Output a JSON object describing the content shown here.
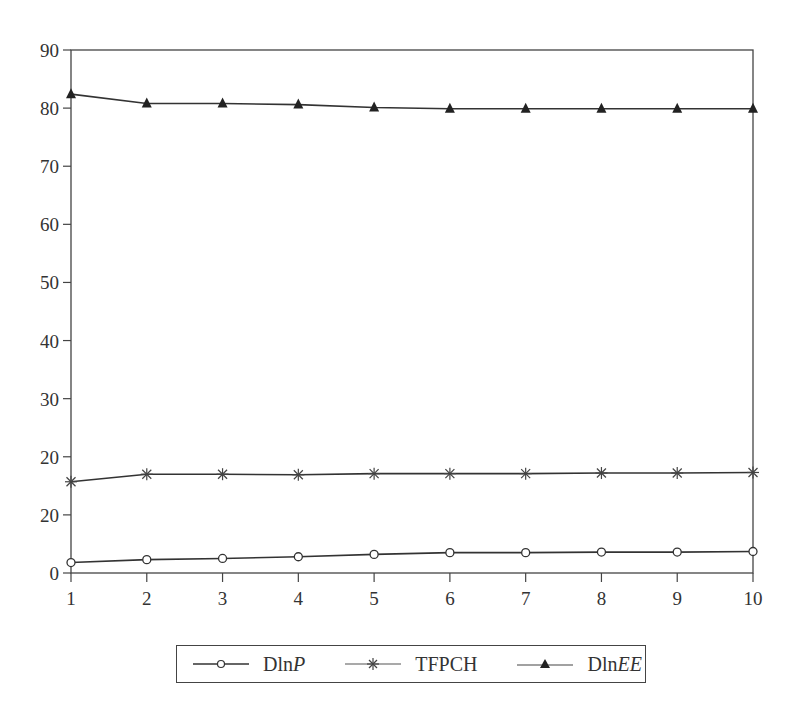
{
  "chart_data": {
    "type": "line",
    "title": "",
    "xlabel": "",
    "ylabel": "",
    "x": [
      1,
      2,
      3,
      4,
      5,
      6,
      7,
      8,
      9,
      10
    ],
    "xlim": [
      1,
      10
    ],
    "ylim": [
      0,
      90
    ],
    "y_ticks": [
      0,
      10,
      20,
      30,
      40,
      50,
      60,
      70,
      80,
      90
    ],
    "y_tick_labels": [
      "0",
      "20",
      "20",
      "30",
      "40",
      "50",
      "60",
      "70",
      "80",
      "90"
    ],
    "x_tick_labels": [
      "1",
      "2",
      "3",
      "4",
      "5",
      "6",
      "7",
      "8",
      "9",
      "10"
    ],
    "grid": false,
    "legend_position": "bottom",
    "series": [
      {
        "name": "DlnP",
        "name_plain": "Dln",
        "name_italic": "P",
        "marker": "open-circle",
        "values": [
          1.8,
          2.3,
          2.5,
          2.8,
          3.2,
          3.5,
          3.5,
          3.6,
          3.6,
          3.7
        ]
      },
      {
        "name": "TFPCH",
        "name_plain": "TFPCH",
        "name_italic": "",
        "marker": "asterisk",
        "values": [
          15.7,
          17.0,
          17.0,
          16.9,
          17.1,
          17.1,
          17.1,
          17.2,
          17.2,
          17.3
        ]
      },
      {
        "name": "DlnEE",
        "name_plain": "Dln",
        "name_italic": "EE",
        "marker": "filled-triangle",
        "values": [
          82.4,
          80.8,
          80.8,
          80.6,
          80.1,
          79.9,
          79.9,
          79.9,
          79.9,
          79.9
        ]
      }
    ]
  },
  "colors": {
    "line": "#333333",
    "axis": "#444444",
    "background": "#ffffff"
  }
}
